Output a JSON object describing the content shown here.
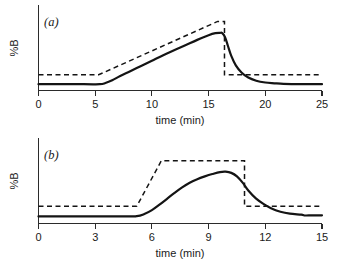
{
  "figure": {
    "background": "#ffffff",
    "ink_color": "#141414",
    "panel_count": 2
  },
  "chart_data": [
    {
      "type": "line",
      "panel_label": "(a)",
      "title": "",
      "xlabel": "time (min)",
      "ylabel": "%B",
      "xlim": [
        0,
        25
      ],
      "ylim": [
        0,
        100
      ],
      "xticks": [
        0,
        5,
        10,
        15,
        20,
        25
      ],
      "xtick_labels": [
        "0",
        "5",
        "10",
        "15",
        "20",
        "25"
      ],
      "yticks": [],
      "ytick_labels": [],
      "grid": false,
      "legend": "none",
      "series": [
        {
          "name": "programmed gradient",
          "style": "dashed",
          "x": [
            0,
            5.3,
            15.8,
            16.4,
            16.4,
            25
          ],
          "values": [
            20,
            20,
            88,
            88,
            20,
            20
          ]
        },
        {
          "name": "actual gradient",
          "style": "solid",
          "x": [
            0,
            4.0,
            5.4,
            5.9,
            6.5,
            7.2,
            8.0,
            9.0,
            10.0,
            11.0,
            12.0,
            13.0,
            14.0,
            15.0,
            15.6,
            16.0,
            16.2,
            16.45,
            16.7,
            17.0,
            17.4,
            17.9,
            18.5,
            19.2,
            20.0,
            20.8,
            21.6,
            22.6,
            23.6,
            25.0
          ],
          "values": [
            8,
            8,
            8,
            9.5,
            13,
            18.5,
            24,
            31,
            38,
            45,
            51.5,
            58,
            64.5,
            70.5,
            73,
            73.4,
            73.2,
            68,
            57,
            44,
            32,
            23,
            16.5,
            12.5,
            10.2,
            9.2,
            8.4,
            8.2,
            8.1,
            8.1
          ]
        }
      ]
    },
    {
      "type": "line",
      "panel_label": "(b)",
      "title": "",
      "xlabel": "time (min)",
      "ylabel": "%B",
      "xlim": [
        0,
        15
      ],
      "ylim": [
        0,
        100
      ],
      "xticks": [
        0,
        3,
        6,
        9,
        12,
        15
      ],
      "xtick_labels": [
        "0",
        "3",
        "6",
        "9",
        "12",
        "15"
      ],
      "yticks": [],
      "ytick_labels": [],
      "grid": false,
      "legend": "none",
      "series": [
        {
          "name": "programmed gradient",
          "style": "dashed",
          "x": [
            0,
            5.2,
            6.5,
            10.9,
            10.9,
            15
          ],
          "values": [
            22,
            22,
            80,
            80,
            22,
            22
          ]
        },
        {
          "name": "actual gradient",
          "style": "solid",
          "x": [
            0,
            4.4,
            5.2,
            5.6,
            6.0,
            6.4,
            6.8,
            7.2,
            7.6,
            8.0,
            8.4,
            8.8,
            9.2,
            9.6,
            9.9,
            10.2,
            10.5,
            10.8,
            11.1,
            11.5,
            11.9,
            12.3,
            12.8,
            13.3,
            13.9,
            14.1,
            14.3,
            15.0
          ],
          "values": [
            9,
            9,
            9.3,
            12,
            17,
            24,
            31.5,
            39,
            46,
            52,
            56.5,
            60,
            63,
            65.5,
            66,
            64.5,
            60,
            52,
            42,
            32,
            25,
            19.5,
            15,
            12.5,
            11.2,
            10.2,
            10.4,
            10.4
          ]
        }
      ]
    }
  ],
  "panels": {
    "a": {
      "label": "(a)",
      "xlabel": "time (min)",
      "ylabel": "%B",
      "xtick_labels": [
        "0",
        "5",
        "10",
        "15",
        "20",
        "25"
      ]
    },
    "b": {
      "label": "(b)",
      "xlabel": "time (min)",
      "ylabel": "%B",
      "xtick_labels": [
        "0",
        "3",
        "6",
        "9",
        "12",
        "15"
      ]
    }
  }
}
